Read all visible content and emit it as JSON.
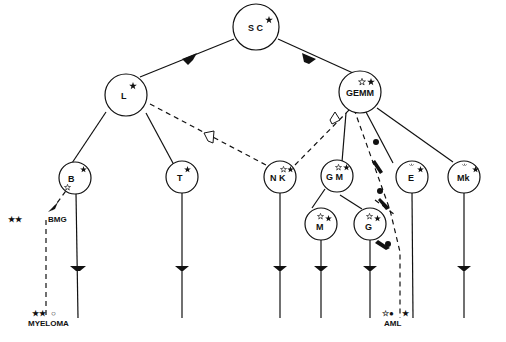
{
  "diagram": {
    "nodes": {
      "sc": {
        "label": "S C",
        "marks": "filled-star"
      },
      "l": {
        "label": "L",
        "marks": "filled-star"
      },
      "gemm": {
        "label": "GEMM",
        "marks": "open-star, filled-star"
      },
      "b": {
        "label": "B",
        "marks": "filled-star, open-star"
      },
      "t": {
        "label": "T",
        "marks": "filled-star"
      },
      "nk": {
        "label": "N K",
        "marks": "open-star, filled-star"
      },
      "gm": {
        "label": "G M",
        "marks": "open-star, filled-star"
      },
      "e": {
        "label": "E",
        "marks": "rays, filled-star"
      },
      "mk": {
        "label": "Mk",
        "marks": "rays, filled-star"
      },
      "m": {
        "label": "M",
        "marks": "open-star, filled-star"
      },
      "g": {
        "label": "G",
        "marks": "open-star, filled-star"
      }
    },
    "disease_labels": {
      "bmg": "BMG",
      "myeloma": "MYELOMA",
      "aml": "AML"
    },
    "legend_marks": {
      "bmg_prefix": "★★",
      "myeloma_prefix": "★★",
      "myeloma_suffix": "○",
      "aml_prefix": "☆●",
      "aml_suffix": "★"
    }
  }
}
